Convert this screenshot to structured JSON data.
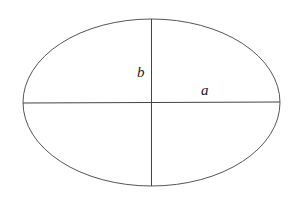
{
  "diagram": {
    "type": "ellipse-axes",
    "ellipse": {
      "cx": 151.5,
      "cy": 102.5,
      "rx": 128.5,
      "ry": 83.5,
      "stroke": "#555555"
    },
    "axes": {
      "major": {
        "x1": 23,
        "y1": 103,
        "x2": 280,
        "y2": 102,
        "stroke": "#444444"
      },
      "minor": {
        "x1": 151.5,
        "y1": 19,
        "x2": 151.5,
        "y2": 186,
        "stroke": "#444444"
      }
    },
    "labels": {
      "semi_minor": "b",
      "semi_major": "a"
    }
  }
}
